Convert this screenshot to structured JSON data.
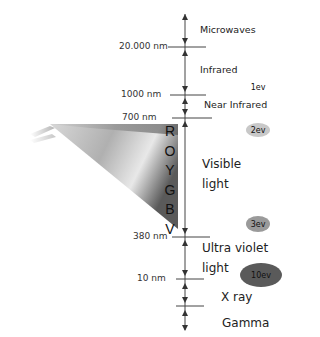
{
  "diagram": {
    "boundaries": [
      {
        "label": "20.000 nm",
        "y": 47
      },
      {
        "label": "1000 nm",
        "y": 95
      },
      {
        "label": "700 nm",
        "y": 118
      },
      {
        "label": "380 nm",
        "y": 237
      },
      {
        "label": "10 nm",
        "y": 279
      },
      {
        "label": "",
        "y": 306
      }
    ],
    "bands": [
      {
        "name": "Microwaves"
      },
      {
        "name": "Infrared"
      },
      {
        "name": "Near Infrared"
      },
      {
        "name": "Visible light",
        "line1": "Visible",
        "line2": "light"
      },
      {
        "name": "Ultra violet light",
        "line1": "Ultra violet",
        "line2": "light"
      },
      {
        "name": "X ray"
      },
      {
        "name": "Gamma"
      }
    ],
    "spectrum_letters": [
      "R",
      "O",
      "Y",
      "G",
      "B",
      "V"
    ],
    "energy_markers": [
      {
        "label": "1ev",
        "color": "#ffffff"
      },
      {
        "label": "2ev",
        "color": "#c8c8c8"
      },
      {
        "label": "3ev",
        "color": "#9a9a9a"
      },
      {
        "label": "10ev",
        "color": "#5a5a5a"
      }
    ]
  }
}
